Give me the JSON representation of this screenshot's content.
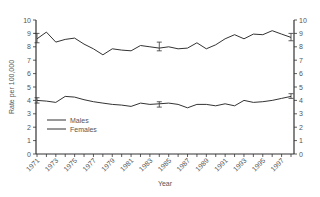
{
  "chart_data": {
    "type": "line",
    "title": "",
    "xlabel": "Year",
    "ylabel": "Rate per 100,000",
    "ylim": [
      0,
      10
    ],
    "y_ticks": [
      0,
      1,
      2,
      3,
      4,
      5,
      6,
      7,
      8,
      9,
      10
    ],
    "secondary_y_ticks": [
      0,
      1,
      2,
      3,
      4,
      5,
      6,
      7,
      8,
      9,
      10
    ],
    "x": [
      1971,
      1972,
      1973,
      1974,
      1975,
      1976,
      1977,
      1978,
      1979,
      1980,
      1981,
      1982,
      1983,
      1984,
      1985,
      1986,
      1987,
      1988,
      1989,
      1990,
      1991,
      1992,
      1993,
      1994,
      1995,
      1996,
      1997,
      1998
    ],
    "x_tick_labels": [
      "1971",
      "1973",
      "1975",
      "1977",
      "1979",
      "1981",
      "1983",
      "1985",
      "1987",
      "1989",
      "1991",
      "1993",
      "1995",
      "1997"
    ],
    "series": [
      {
        "name": "Males",
        "values": [
          8.6,
          9.1,
          8.35,
          8.55,
          8.65,
          8.2,
          7.85,
          7.4,
          7.85,
          7.75,
          7.7,
          8.1,
          8.0,
          7.9,
          8.0,
          7.85,
          7.9,
          8.3,
          7.85,
          8.15,
          8.6,
          8.9,
          8.6,
          8.95,
          8.9,
          9.2,
          8.95,
          8.7
        ],
        "error_bars": [
          {
            "x": 1971,
            "low": 8.3,
            "high": 9.0
          },
          {
            "x": 1984,
            "low": 7.7,
            "high": 8.35
          },
          {
            "x": 1998,
            "low": 8.45,
            "high": 9.0
          }
        ]
      },
      {
        "name": "Females",
        "values": [
          4.0,
          3.95,
          3.85,
          4.3,
          4.25,
          4.05,
          3.9,
          3.8,
          3.7,
          3.65,
          3.55,
          3.8,
          3.7,
          3.75,
          3.8,
          3.7,
          3.45,
          3.7,
          3.7,
          3.6,
          3.75,
          3.6,
          4.0,
          3.85,
          3.9,
          4.0,
          4.15,
          4.3
        ],
        "error_bars": [
          {
            "x": 1971,
            "low": 3.8,
            "high": 4.2
          },
          {
            "x": 1984,
            "low": 3.5,
            "high": 3.9
          },
          {
            "x": 1998,
            "low": 4.15,
            "high": 4.5
          }
        ]
      }
    ],
    "legend": {
      "position": "lower-left inside",
      "entries": [
        "Males",
        "Females"
      ]
    },
    "grid": false,
    "line_color": "#333333"
  }
}
